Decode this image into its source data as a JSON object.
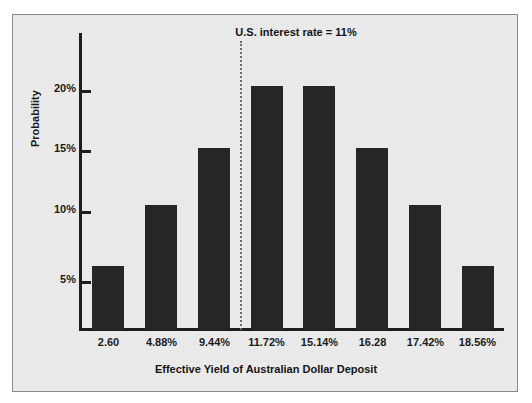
{
  "chart_data": {
    "type": "bar",
    "title": "",
    "xlabel": "Effective Yield of Australian Dollar Deposit",
    "ylabel": "Probability",
    "categories": [
      "2.60",
      "4.88%",
      "9.44%",
      "11.72%",
      "15.14%",
      "16.28",
      "17.42%",
      "18.56%"
    ],
    "values": [
      5.3,
      10.4,
      15.2,
      20.3,
      20.3,
      15.2,
      10.4,
      5.3
    ],
    "ylim": [
      0,
      23
    ],
    "ytick_values": [
      5,
      10,
      15,
      20
    ],
    "ytick_labels": [
      "5%",
      "10%",
      "15%",
      "20%"
    ],
    "grid": false,
    "legend": null,
    "bar_color": "#262626",
    "background_color": "#ececed",
    "annotations": [
      {
        "name": "us-interest-rate-reference",
        "text": "U.S. interest rate = 11%",
        "line_style": "dotted",
        "line_color": "#6b6b6b",
        "position_between_categories": [
          "9.44%",
          "11.72%"
        ]
      }
    ]
  }
}
